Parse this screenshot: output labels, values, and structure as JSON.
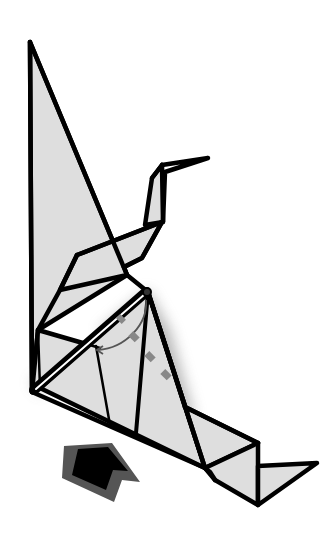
{
  "diagram": {
    "title": "Origami crane folding step",
    "colors": {
      "background": "#ffffff",
      "paper": "#dedede",
      "outline": "#000000",
      "fold_arrow": "#555555",
      "valley_fold": "#888888",
      "push_arrow_fill": "#000000",
      "push_arrow_border": "#555555"
    },
    "elements": {
      "crane_body": "crane-body",
      "neck_and_head": "crane-neck-head",
      "tail": "crane-tail",
      "fold_arrow": "curved-fold-arrow",
      "valley_fold_line": "dashed-fold-line",
      "push_arrow": "push-arrow-icon"
    }
  }
}
